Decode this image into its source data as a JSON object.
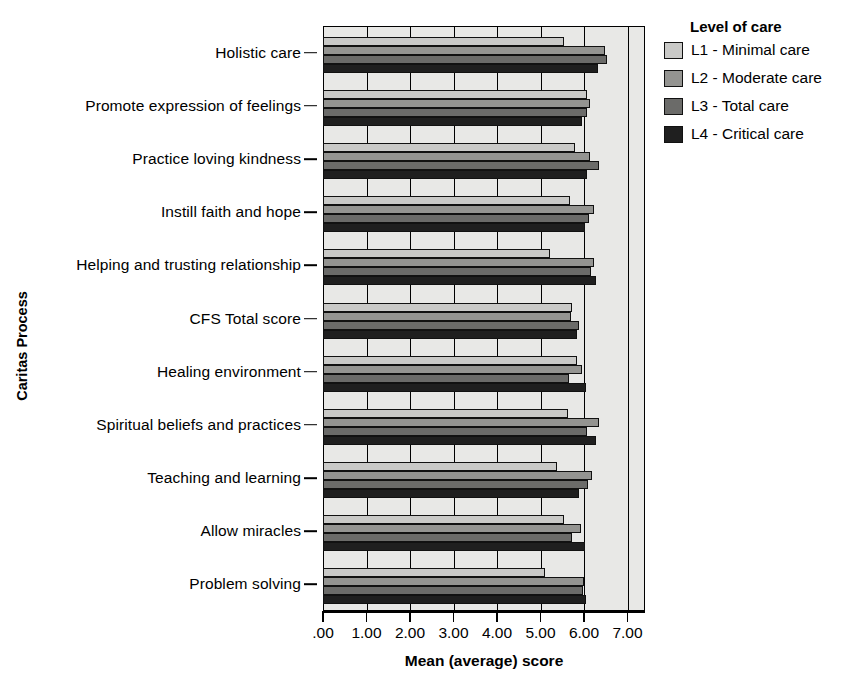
{
  "chart_data": {
    "type": "bar",
    "orientation": "horizontal",
    "title": "",
    "xlabel": "Mean (average) score",
    "ylabel": "Caritas Process",
    "xlim": [
      0,
      7.4
    ],
    "xticks": [
      0,
      1,
      2,
      3,
      4,
      5,
      6,
      7
    ],
    "xticklabels": [
      ".00",
      "1.00",
      "2.00",
      "3.00",
      "4.00",
      "5.00",
      "6.00",
      "7.00"
    ],
    "grid": true,
    "legend_title": "Level of care",
    "legend_position": "right",
    "categories": [
      "Holistic care",
      "Promote expression of feelings",
      "Practice loving kindness",
      "Instill faith and hope",
      "Helping and trusting relationship",
      "CFS Total score",
      "Healing environment",
      "Spiritual beliefs and practices",
      "Teaching and learning",
      "Allow miracles",
      "Problem solving"
    ],
    "series": [
      {
        "name": "L1 - Minimal care",
        "color": "#c9c9c7",
        "values": [
          5.55,
          6.08,
          5.8,
          5.68,
          5.22,
          5.72,
          5.85,
          5.63,
          5.38,
          5.55,
          5.1
        ]
      },
      {
        "name": "L2 - Moderate care",
        "color": "#949491",
        "values": [
          6.48,
          6.13,
          6.13,
          6.22,
          6.22,
          5.7,
          5.95,
          6.35,
          6.18,
          5.93,
          6.0
        ]
      },
      {
        "name": "L3 - Total care",
        "color": "#6b6b69",
        "values": [
          6.54,
          6.06,
          6.35,
          6.12,
          6.15,
          5.88,
          5.65,
          6.08,
          6.1,
          5.72,
          5.98
        ]
      },
      {
        "name": "L4 - Critical care",
        "color": "#1f1f1f",
        "values": [
          6.32,
          5.95,
          6.07,
          6.03,
          6.28,
          5.84,
          6.05,
          6.28,
          5.88,
          6.02,
          6.05
        ]
      }
    ]
  },
  "legend": {
    "title": "Level of care",
    "entries": [
      {
        "label": "L1 - Minimal care",
        "color": "#c9c9c7"
      },
      {
        "label": "L2 - Moderate care",
        "color": "#949491"
      },
      {
        "label": "L3 - Total care",
        "color": "#6b6b69"
      },
      {
        "label": "L4 - Critical care",
        "color": "#1f1f1f"
      }
    ]
  },
  "axes": {
    "x_title": "Mean (average) score",
    "y_title": "Caritas Process"
  }
}
